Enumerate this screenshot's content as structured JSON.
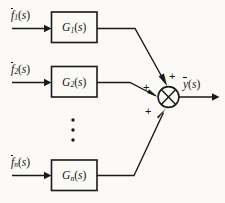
{
  "figure": {
    "kind": "control-system-block-diagram",
    "background_color": "#fbfaf6",
    "line_color": "#1a1a1a"
  },
  "inputs": [
    {
      "id": "f1",
      "base": "f",
      "subscript": "1",
      "arg": "(s)",
      "overbar": true,
      "text": "f1(s)"
    },
    {
      "id": "f2",
      "base": "f",
      "subscript": "2",
      "arg": "(s)",
      "overbar": true,
      "text": "f2(s)"
    },
    {
      "id": "fn",
      "base": "f",
      "subscript": "n",
      "arg": "(s)",
      "overbar": true,
      "text": "fn(s)"
    }
  ],
  "blocks": [
    {
      "id": "G1",
      "base": "G",
      "subscript": "1",
      "arg": "(s)",
      "text": "G1(s)"
    },
    {
      "id": "G2",
      "base": "G",
      "subscript": "2",
      "arg": "(s)",
      "text": "G2(s)"
    },
    {
      "id": "Gn",
      "base": "G",
      "subscript": "n",
      "arg": "(s)",
      "text": "Gn(s)"
    }
  ],
  "summing_junction": {
    "symbol": "circle-with-cross",
    "signs": [
      {
        "id": "sign-top",
        "label": "+"
      },
      {
        "id": "sign-middle",
        "label": "+"
      },
      {
        "id": "sign-bottom",
        "label": "+"
      }
    ]
  },
  "output": {
    "id": "y",
    "base": "y",
    "arg": "(s)",
    "overbar": true,
    "text": "y(s)"
  },
  "ellipsis": {
    "orientation": "vertical",
    "dot_count": 3,
    "meaning": "continuation between block 2 and block n"
  }
}
